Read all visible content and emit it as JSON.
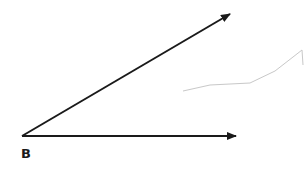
{
  "diagram": {
    "type": "angle",
    "vertex": {
      "label": "B",
      "x": 22,
      "y": 136
    },
    "rays": [
      {
        "name": "upper-ray",
        "from": [
          22,
          136
        ],
        "to": [
          230,
          14
        ],
        "arrow": true
      },
      {
        "name": "horizontal-ray",
        "from": [
          22,
          136
        ],
        "to": [
          236,
          136
        ],
        "arrow": true
      }
    ],
    "stray_marks": [
      {
        "name": "faint-pencil-stroke",
        "points": [
          [
            183,
            91
          ],
          [
            210,
            85
          ],
          [
            250,
            83
          ],
          [
            275,
            71
          ],
          [
            302,
            50
          ],
          [
            303,
            65
          ]
        ],
        "color": "#c8c8c8"
      }
    ],
    "colors": {
      "line": "#1a1a1a",
      "background": "#ffffff",
      "stray": "#c8c8c8"
    }
  }
}
